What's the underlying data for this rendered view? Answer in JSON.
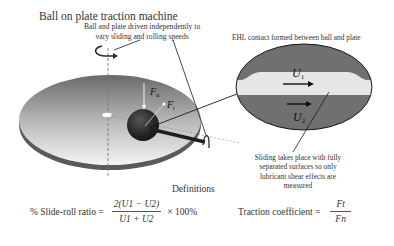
{
  "title": "Ball on plate traction machine",
  "annotations": {
    "driven_note_line1": "Ball and plate driven independently to",
    "driven_note_line2": "vary sliding and rolling speeds",
    "ehl_label": "EHL contact formed between ball and plate",
    "sliding_note": "Sliding takes place with fully separated surfaces so only lubricant shear effects are measured"
  },
  "forces": {
    "normal": "F",
    "normal_sub": "n",
    "tangential": "F",
    "tangential_sub": "t"
  },
  "speeds": {
    "u1": "U",
    "u1_sub": "1",
    "u2": "U",
    "u2_sub": "2"
  },
  "definitions": {
    "heading": "Definitions",
    "slide_roll": {
      "label": "% Slide-roll ratio =",
      "numerator": "2(U1 − U2)",
      "denominator": "U1 + U2",
      "suffix": "× 100%"
    },
    "traction": {
      "label": "Traction coefficient =",
      "numerator": "Ft",
      "denominator": "Fn"
    }
  },
  "colors": {
    "plate_top_dark": "#6e6e6e",
    "plate_top_light": "#f2f2f2",
    "plate_edge": "#5a5a5a",
    "ball": "#2a2a2a",
    "ellipse_fill": "#707070",
    "film": "#e6e6e6",
    "line": "#1a1a1a"
  }
}
